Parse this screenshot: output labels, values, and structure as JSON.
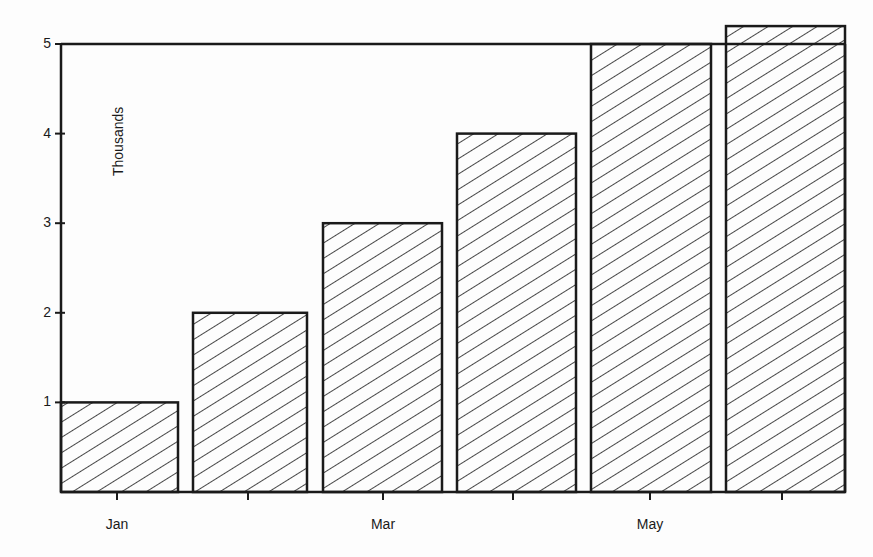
{
  "chart_data": {
    "type": "bar",
    "title": "",
    "xlabel": "",
    "ylabel": "Thousands",
    "categories": [
      "Jan",
      "Feb",
      "Mar",
      "Apr",
      "May",
      "Jun"
    ],
    "values": [
      1,
      2,
      3,
      4,
      5,
      5.2
    ],
    "x_tick_labels": [
      "Jan",
      "",
      "Mar",
      "",
      "May",
      ""
    ],
    "y_ticks": [
      1,
      2,
      3,
      4,
      5
    ],
    "ylim": [
      0,
      5
    ],
    "grid": false,
    "legend": null,
    "bar_fill": "diagonal-hatch"
  },
  "colors": {
    "ink": "#1a1a1a",
    "background": "#fdfdfd"
  }
}
